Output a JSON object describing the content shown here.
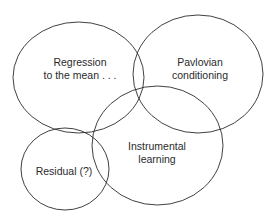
{
  "diagram": {
    "type": "venn",
    "sets": [
      {
        "id": "regression",
        "lines": [
          "Regression",
          "to the mean . . ."
        ],
        "cx": 78.5,
        "cy": 77.5,
        "rx": 65.5,
        "ry": 55.5
      },
      {
        "id": "pavlovian",
        "lines": [
          "Pavlovian",
          "conditioning"
        ],
        "cx": 198,
        "cy": 74,
        "rx": 65,
        "ry": 59
      },
      {
        "id": "instrumental",
        "lines": [
          "Instrumental",
          "learning"
        ],
        "cx": 157.5,
        "cy": 145.5,
        "rx": 65.5,
        "ry": 59.5
      },
      {
        "id": "residual",
        "lines": [
          "Residual (?)"
        ],
        "cx": 65,
        "cy": 169,
        "rx": 44,
        "ry": 41
      }
    ],
    "stroke_color": "#2a2a2a",
    "background": "#ffffff"
  }
}
